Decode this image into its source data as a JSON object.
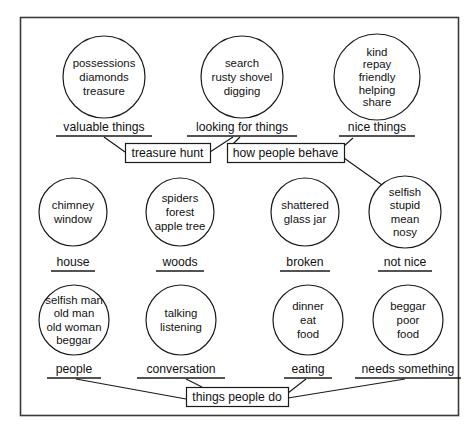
{
  "diagram": {
    "frame": {
      "stroke_color": "#3a3a3a"
    },
    "line_color": "#1a1a1a",
    "background_color": "#ffffff"
  },
  "rows": [
    {
      "row_name": "top-row",
      "cy": 77,
      "bubble_r": 41,
      "label_y": 131,
      "underline_y": 136,
      "items": [
        {
          "cx": 104,
          "r": 41,
          "words": [
            "possessions",
            "diamonds",
            "treasure"
          ],
          "category": "valuable things",
          "underline_half": 48
        },
        {
          "cx": 242,
          "r": 41,
          "words": [
            "search",
            "rusty shovel",
            "digging"
          ],
          "category": "looking for things",
          "underline_half": 55
        },
        {
          "cx": 377,
          "r": 43,
          "words": [
            "kind",
            "repay",
            "friendly",
            "helping",
            "share"
          ],
          "category": "nice things",
          "underline_half": 38
        }
      ]
    },
    {
      "row_name": "middle-row",
      "cy": 212,
      "bubble_r": 34,
      "label_y": 266,
      "underline_y": 271,
      "items": [
        {
          "cx": 73,
          "r": 34,
          "words": [
            "chimney",
            "window"
          ],
          "category": "house",
          "underline_half": 22
        },
        {
          "cx": 180,
          "r": 34,
          "words": [
            "spiders",
            "forest",
            "apple tree"
          ],
          "category": "woods",
          "underline_half": 24
        },
        {
          "cx": 305,
          "r": 34,
          "words": [
            "shattered",
            "glass jar"
          ],
          "category": "broken",
          "underline_half": 25
        },
        {
          "cx": 405,
          "r": 36,
          "words": [
            "selfish",
            "stupid",
            "mean",
            "nosy"
          ],
          "category": "not nice",
          "underline_half": 27
        }
      ]
    },
    {
      "row_name": "bottom-row",
      "cy": 320,
      "bubble_r": 35,
      "label_y": 373,
      "underline_y": 378,
      "items": [
        {
          "cx": 74,
          "r": 35,
          "words": [
            "selfish man",
            "old man",
            "old woman",
            "beggar"
          ],
          "category": "people",
          "underline_half": 27
        },
        {
          "cx": 181,
          "r": 35,
          "words": [
            "talking",
            "listening"
          ],
          "category": "conversation",
          "underline_half": 44
        },
        {
          "cx": 308,
          "r": 35,
          "words": [
            "dinner",
            "eat",
            "food"
          ],
          "category": "eating",
          "underline_half": 24
        },
        {
          "cx": 408,
          "r": 35,
          "words": [
            "beggar",
            "poor",
            "food"
          ],
          "category": "needs something",
          "underline_half": 53
        }
      ]
    }
  ],
  "boxes": [
    {
      "name": "treasure-hunt-box",
      "label": "treasure hunt",
      "x": 125,
      "y": 143,
      "w": 85,
      "h": 19
    },
    {
      "name": "how-people-behave-box",
      "label": "how people behave",
      "x": 227,
      "y": 143,
      "w": 117,
      "h": 19
    },
    {
      "name": "things-people-do-box",
      "label": "things people do",
      "x": 186,
      "y": 387,
      "w": 102,
      "h": 19
    }
  ],
  "connectors": [
    {
      "name": "valuable-things-to-treasure-hunt",
      "x1": 104,
      "y1": 137,
      "x2": 125,
      "y2": 152
    },
    {
      "name": "looking-for-things-to-treasure-hunt",
      "x1": 233,
      "y1": 137,
      "x2": 210,
      "y2": 152
    },
    {
      "name": "nice-things-to-how-people-behave",
      "x1": 353,
      "y1": 138,
      "x2": 344,
      "y2": 146
    },
    {
      "name": "looking-for-things-to-how-people-behave",
      "x1": 240,
      "y1": 137,
      "x2": 227,
      "y2": 150
    },
    {
      "name": "how-people-behave-to-not-nice",
      "x1": 344,
      "y1": 158,
      "x2": 382,
      "y2": 185
    },
    {
      "name": "people-to-things-people-do",
      "x1": 76,
      "y1": 379,
      "x2": 186,
      "y2": 399
    },
    {
      "name": "conversation-to-things-people-do",
      "x1": 186,
      "y1": 379,
      "x2": 202,
      "y2": 387
    },
    {
      "name": "eating-to-things-people-do",
      "x1": 306,
      "y1": 379,
      "x2": 288,
      "y2": 393
    },
    {
      "name": "needs-something-to-things-people-do",
      "x1": 405,
      "y1": 379,
      "x2": 288,
      "y2": 398
    }
  ]
}
